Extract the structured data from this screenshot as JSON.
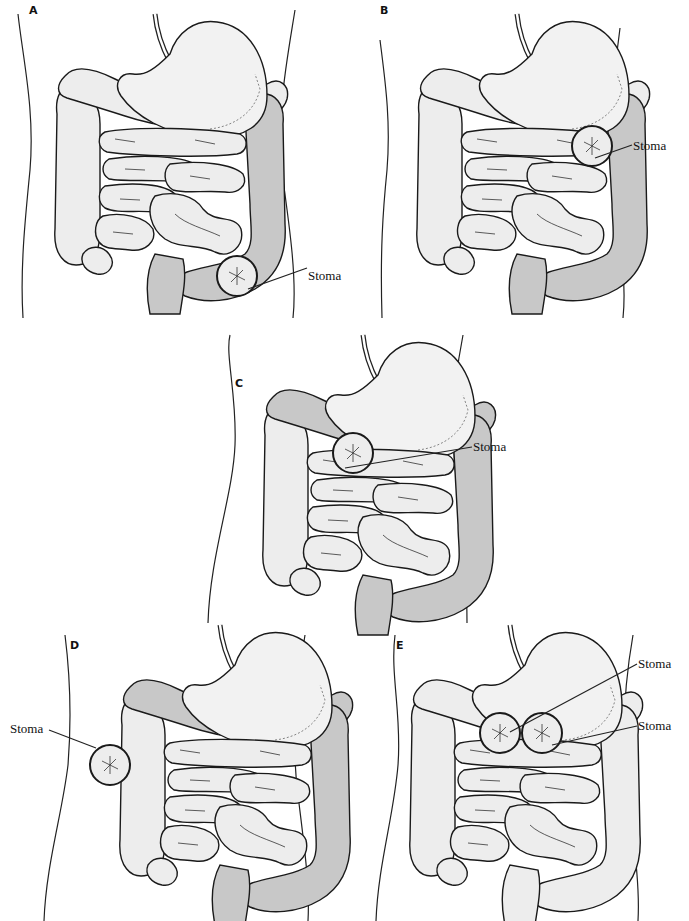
{
  "figure": {
    "colors": {
      "active_bowel": "#ededed",
      "excluded_bowel": "#c8c8c8",
      "outline": "#1a1a1a",
      "background": "#ffffff"
    },
    "panels": [
      {
        "id": "A",
        "label": "A",
        "stoma_labels": [
          "Stoma"
        ],
        "stoma_site": "sigmoid colon (lower left abdomen)"
      },
      {
        "id": "B",
        "label": "B",
        "stoma_labels": [
          "Stoma"
        ],
        "stoma_site": "descending colon (left abdomen)"
      },
      {
        "id": "C",
        "label": "C",
        "stoma_labels": [
          "Stoma"
        ],
        "stoma_site": "transverse colon (right of midline)"
      },
      {
        "id": "D",
        "label": "D",
        "stoma_labels": [
          "Stoma"
        ],
        "stoma_site": "ascending colon (right abdomen)"
      },
      {
        "id": "E",
        "label": "E",
        "stoma_labels": [
          "Stoma",
          "Stoma"
        ],
        "stoma_site": "double-barrel transverse colostomy"
      }
    ]
  }
}
